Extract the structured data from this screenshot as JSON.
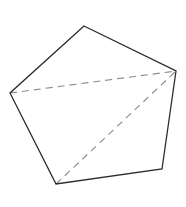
{
  "diagram": {
    "type": "geometry",
    "shape": "pentagon",
    "vertices": [
      {
        "x": 84,
        "y": 26
      },
      {
        "x": 176,
        "y": 71
      },
      {
        "x": 162,
        "y": 169
      },
      {
        "x": 56,
        "y": 184
      },
      {
        "x": 10,
        "y": 93
      }
    ],
    "diagonals": [
      {
        "from": 4,
        "to": 1
      },
      {
        "from": 3,
        "to": 1
      }
    ],
    "colors": {
      "edge": "#2b2b2b",
      "diagonal": "#8a8a8a",
      "background": "#ffffff"
    },
    "edge_width": 1.3,
    "diagonal_width": 1.1,
    "diagonal_dash": "7 5"
  }
}
